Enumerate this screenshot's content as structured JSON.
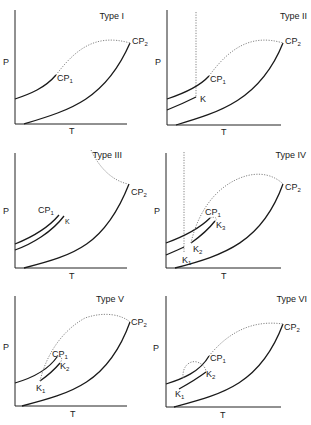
{
  "figure": {
    "axis_labels": {
      "x": "T",
      "y": "P"
    },
    "panels": [
      {
        "title": "Type I",
        "labels": [
          "CP",
          "1",
          "CP",
          "2"
        ]
      },
      {
        "title": "Type II",
        "labels": [
          "CP",
          "1",
          "CP",
          "2",
          "K"
        ]
      },
      {
        "title": "Type III",
        "labels": [
          "CP",
          "1",
          "CP",
          "2",
          "K"
        ]
      },
      {
        "title": "Type IV",
        "labels": [
          "CP",
          "1",
          "CP",
          "2",
          "K",
          "1",
          "K",
          "2",
          "K",
          "3"
        ]
      },
      {
        "title": "Type V",
        "labels": [
          "CP",
          "1",
          "CP",
          "2",
          "K",
          "1",
          "K",
          "2"
        ]
      },
      {
        "title": "Type VI",
        "labels": [
          "CP",
          "1",
          "CP",
          "2",
          "K",
          "1",
          "K",
          "2"
        ]
      }
    ]
  }
}
